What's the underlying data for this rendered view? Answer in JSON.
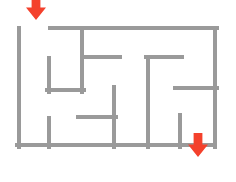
{
  "figure": {
    "kind": "maze-puzzle",
    "width": 236,
    "height": 182,
    "background_color": "#ffffff",
    "title": ""
  },
  "style": {
    "wall_color": "#9a9a9a",
    "wall_thickness": 4,
    "arrow_color": "#f4412c"
  },
  "maze": {
    "bounds": {
      "left": 19,
      "top": 28,
      "right": 215,
      "bottom": 145
    },
    "cell_size": 32.6,
    "columns": 6,
    "rows": 4,
    "walls": [
      {
        "name": "border-left",
        "orientation": "vertical",
        "x": 19,
        "y1": 28,
        "y2": 147
      },
      {
        "name": "border-bottom",
        "orientation": "horizontal",
        "y": 145,
        "x1": 17,
        "x2": 215
      },
      {
        "name": "border-right",
        "orientation": "vertical",
        "x": 215,
        "y1": 28,
        "y2": 147
      },
      {
        "name": "border-top-right-of-entry",
        "orientation": "horizontal",
        "y": 28,
        "x1": 50,
        "x2": 217
      },
      {
        "name": "inner-vertical-col1-upper",
        "orientation": "vertical",
        "x": 49,
        "y1": 58,
        "y2": 92
      },
      {
        "name": "inner-horizontal-col1-bottom",
        "orientation": "horizontal",
        "y": 90,
        "x1": 47,
        "x2": 84
      },
      {
        "name": "inner-vertical-col2-upper",
        "orientation": "vertical",
        "x": 82,
        "y1": 28,
        "y2": 92
      },
      {
        "name": "inner-horizontal-mid-left",
        "orientation": "horizontal",
        "y": 57,
        "x1": 82,
        "x2": 120
      },
      {
        "name": "inner-vertical-col1-lower",
        "orientation": "vertical",
        "x": 49,
        "y1": 118,
        "y2": 147
      },
      {
        "name": "inner-vertical-center",
        "orientation": "vertical",
        "x": 114,
        "y1": 87,
        "y2": 147
      },
      {
        "name": "inner-horizontal-lower-left",
        "orientation": "horizontal",
        "y": 117,
        "x1": 78,
        "x2": 116
      },
      {
        "name": "inner-vertical-right-block",
        "orientation": "vertical",
        "x": 148,
        "y1": 57,
        "y2": 147
      },
      {
        "name": "inner-horizontal-right-top",
        "orientation": "horizontal",
        "y": 57,
        "x1": 146,
        "x2": 182
      },
      {
        "name": "inner-horizontal-right-mid",
        "orientation": "horizontal",
        "y": 88,
        "x1": 175,
        "x2": 217
      },
      {
        "name": "inner-vertical-right-lower",
        "orientation": "vertical",
        "x": 180,
        "y1": 115,
        "y2": 147
      }
    ]
  },
  "markers": [
    {
      "name": "entry-arrow",
      "label": "entrance",
      "direction": "down",
      "x": 36,
      "y": 20,
      "width": 20,
      "height": 24
    },
    {
      "name": "exit-arrow",
      "label": "exit",
      "direction": "down",
      "x": 198,
      "y": 157,
      "width": 20,
      "height": 24
    }
  ]
}
